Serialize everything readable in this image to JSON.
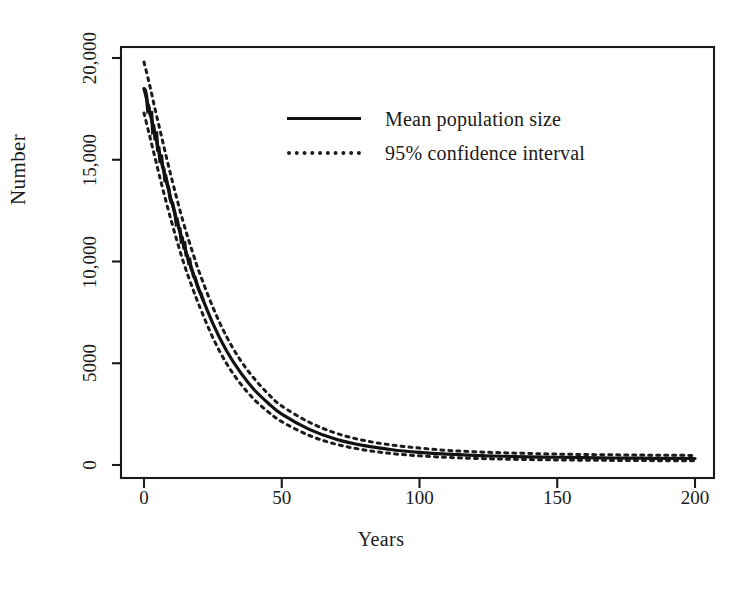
{
  "chart_data": {
    "type": "line",
    "title": "",
    "xlabel": "Years",
    "ylabel": "Number",
    "xlim": [
      0,
      200
    ],
    "ylim": [
      0,
      20000
    ],
    "grid": false,
    "legend_position": "top-right",
    "xticks": [
      "0",
      "50",
      "100",
      "150",
      "200"
    ],
    "xtick_values": [
      0,
      50,
      100,
      150,
      200
    ],
    "yticks": [
      "0",
      "5000",
      "10,000",
      "15,000",
      "20,000"
    ],
    "ytick_values": [
      0,
      5000,
      10000,
      15000,
      20000
    ],
    "x": [
      0,
      2,
      4,
      6,
      8,
      10,
      12,
      14,
      16,
      18,
      20,
      25,
      30,
      35,
      40,
      45,
      50,
      60,
      70,
      80,
      90,
      100,
      110,
      120,
      130,
      140,
      150,
      160,
      170,
      180,
      190,
      200
    ],
    "series": [
      {
        "name": "Mean population size",
        "style": "solid",
        "color": "#121212",
        "values": [
          18500,
          17400,
          16250,
          15100,
          14000,
          12950,
          11950,
          11000,
          10150,
          9350,
          8600,
          6950,
          5600,
          4550,
          3700,
          3050,
          2500,
          1750,
          1250,
          950,
          750,
          620,
          530,
          470,
          430,
          400,
          380,
          360,
          345,
          335,
          325,
          320
        ]
      },
      {
        "name": "95% confidence interval upper",
        "style": "dotted",
        "color": "#1c1c1c",
        "values": [
          19800,
          18700,
          17500,
          16350,
          15200,
          14100,
          13050,
          12050,
          11150,
          10300,
          9500,
          7750,
          6300,
          5150,
          4250,
          3500,
          2900,
          2100,
          1550,
          1200,
          980,
          830,
          720,
          650,
          600,
          565,
          535,
          515,
          500,
          488,
          478,
          470
        ]
      },
      {
        "name": "95% confidence interval lower",
        "style": "dotted",
        "color": "#1c1c1c",
        "values": [
          17300,
          16200,
          15100,
          14000,
          12950,
          11950,
          11000,
          10100,
          9300,
          8550,
          7850,
          6250,
          4980,
          4000,
          3220,
          2620,
          2130,
          1450,
          1010,
          740,
          560,
          450,
          375,
          325,
          290,
          265,
          248,
          235,
          225,
          218,
          212,
          208
        ]
      }
    ],
    "legend": [
      {
        "label": "Mean population size",
        "style": "solid",
        "sample": "solid-line-sample"
      },
      {
        "label": "95% confidence interval",
        "style": "dotted",
        "sample": "dotted-line-sample"
      }
    ]
  },
  "caption": {
    "text": ""
  }
}
